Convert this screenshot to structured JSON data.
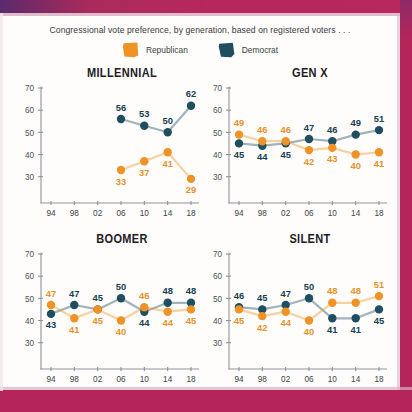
{
  "page": {
    "border_color": "#b4265a",
    "border_accent_color": "#5b2a6e",
    "background": "#fefdfc"
  },
  "header": {
    "headline": "Congressional vote preference, by generation, based on registered voters . . ."
  },
  "legend": {
    "position": "top-center",
    "items": [
      {
        "label": "Republican",
        "color": "#ef9326",
        "swatch_name": "republican-swatch"
      },
      {
        "label": "Democrat",
        "color": "#1f4e5f",
        "swatch_name": "democrat-swatch"
      }
    ]
  },
  "axis": {
    "y_ticks": [
      "70",
      "60",
      "50",
      "40",
      "30"
    ],
    "y_values": [
      70,
      60,
      50,
      40,
      30
    ],
    "x_ticks": [
      "94",
      "98",
      "02",
      "06",
      "10",
      "14",
      "18"
    ],
    "ylim": [
      24,
      70
    ],
    "grid": false
  },
  "chart_data": [
    {
      "type": "line",
      "title": "MILLENNIAL",
      "categories": [
        "94",
        "98",
        "02",
        "06",
        "10",
        "14",
        "18"
      ],
      "xlabel": "",
      "ylabel": "",
      "ylim": [
        24,
        70
      ],
      "series": [
        {
          "name": "Democrat",
          "color": "#1f4e5f",
          "values": [
            null,
            null,
            null,
            56,
            53,
            50,
            62
          ],
          "label_pos": [
            "",
            "",
            "",
            "above",
            "above",
            "above",
            "above"
          ]
        },
        {
          "name": "Republican",
          "color": "#ef9326",
          "values": [
            null,
            null,
            null,
            33,
            37,
            41,
            29
          ],
          "label_pos": [
            "",
            "",
            "",
            "below",
            "below",
            "below",
            "below"
          ]
        }
      ]
    },
    {
      "type": "line",
      "title": "GEN X",
      "categories": [
        "94",
        "98",
        "02",
        "06",
        "10",
        "14",
        "18"
      ],
      "xlabel": "",
      "ylabel": "",
      "ylim": [
        24,
        70
      ],
      "series": [
        {
          "name": "Democrat",
          "color": "#1f4e5f",
          "values": [
            45,
            44,
            45,
            47,
            46,
            49,
            51
          ],
          "label_pos": [
            "below",
            "below",
            "below",
            "above",
            "above",
            "above",
            "above"
          ]
        },
        {
          "name": "Republican",
          "color": "#ef9326",
          "values": [
            49,
            46,
            46,
            42,
            43,
            40,
            41
          ],
          "label_pos": [
            "above",
            "above",
            "above",
            "below",
            "below",
            "below",
            "below"
          ]
        }
      ]
    },
    {
      "type": "line",
      "title": "BOOMER",
      "categories": [
        "94",
        "98",
        "02",
        "06",
        "10",
        "14",
        "18"
      ],
      "xlabel": "",
      "ylabel": "",
      "ylim": [
        24,
        70
      ],
      "series": [
        {
          "name": "Democrat",
          "color": "#1f4e5f",
          "values": [
            43,
            47,
            45,
            50,
            44,
            48,
            48
          ],
          "label_pos": [
            "below",
            "above",
            "above",
            "above",
            "below",
            "above",
            "above"
          ]
        },
        {
          "name": "Republican",
          "color": "#ef9326",
          "values": [
            47,
            41,
            45,
            40,
            46,
            44,
            45
          ],
          "label_pos": [
            "above",
            "below",
            "below",
            "below",
            "above",
            "below",
            "below"
          ]
        }
      ]
    },
    {
      "type": "line",
      "title": "SILENT",
      "categories": [
        "94",
        "98",
        "02",
        "06",
        "10",
        "14",
        "18"
      ],
      "xlabel": "",
      "ylabel": "",
      "ylim": [
        24,
        70
      ],
      "series": [
        {
          "name": "Democrat",
          "color": "#1f4e5f",
          "values": [
            46,
            45,
            47,
            50,
            41,
            41,
            45
          ],
          "label_pos": [
            "above",
            "above",
            "above",
            "above",
            "below",
            "below",
            "below"
          ]
        },
        {
          "name": "Republican",
          "color": "#ef9326",
          "values": [
            45,
            42,
            44,
            40,
            48,
            48,
            51
          ],
          "label_pos": [
            "below",
            "below",
            "below",
            "below",
            "above",
            "above",
            "above"
          ]
        }
      ]
    }
  ]
}
